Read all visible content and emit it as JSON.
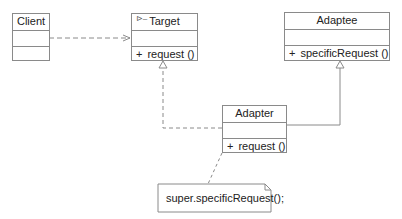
{
  "diagram": {
    "type": "UML class diagram",
    "pattern": "Adapter",
    "classes": {
      "client": {
        "name": "Client",
        "attributes": [],
        "operations": []
      },
      "target": {
        "name": "Target",
        "stereotype_icon": "interface-icon",
        "attributes": [],
        "operations": [
          {
            "visibility": "+",
            "signature": "request ()"
          }
        ]
      },
      "adaptee": {
        "name": "Adaptee",
        "attributes": [],
        "operations": [
          {
            "visibility": "+",
            "signature": "specificRequest ()"
          }
        ]
      },
      "adapter": {
        "name": "Adapter",
        "attributes": [],
        "operations": [
          {
            "visibility": "+",
            "signature": "request ()"
          }
        ]
      }
    },
    "note": {
      "text": "super.specificRequest();",
      "attached_to": "Adapter"
    },
    "relations": [
      {
        "from": "Client",
        "to": "Target",
        "kind": "dependency",
        "style": "dashed",
        "arrow": "open"
      },
      {
        "from": "Adapter",
        "to": "Target",
        "kind": "realization",
        "style": "dashed",
        "arrow": "hollow-triangle"
      },
      {
        "from": "Adapter",
        "to": "Adaptee",
        "kind": "generalization",
        "style": "solid",
        "arrow": "hollow-triangle"
      },
      {
        "from": "Note",
        "to": "Adapter",
        "kind": "note-anchor",
        "style": "dashed",
        "arrow": "none"
      }
    ],
    "colors": {
      "line": "#8a8a8a",
      "text": "#222222",
      "background": "#ffffff"
    }
  }
}
